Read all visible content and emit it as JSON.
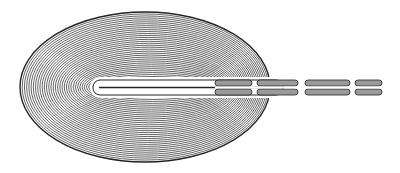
{
  "figure": {
    "colors": {
      "background": "#ffffff",
      "ink": "#222222",
      "fill": "#9a9a9a"
    },
    "coil": {
      "cx": 145,
      "cy": 87,
      "rx": 125,
      "ry": 75,
      "rings": 34
    },
    "slot": {
      "x": 93,
      "y": 80,
      "width": 130,
      "height": 15
    },
    "segments": [
      {
        "x": 215,
        "width": 37
      },
      {
        "x": 257,
        "width": 41
      },
      {
        "x": 305,
        "width": 45
      },
      {
        "x": 355,
        "width": 27
      }
    ]
  }
}
